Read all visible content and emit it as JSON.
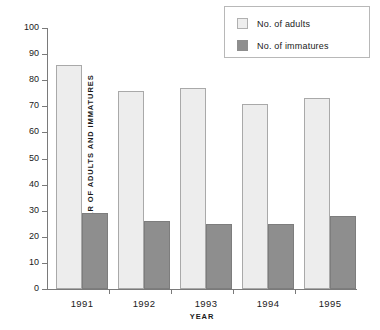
{
  "chart_data": {
    "type": "bar",
    "title": "",
    "xlabel": "YEAR",
    "ylabel": "NUMBER OF ADULTS AND IMMATURES",
    "categories": [
      "1991",
      "1992",
      "1993",
      "1994",
      "1995"
    ],
    "series": [
      {
        "name": "No. of adults",
        "values": [
          86,
          76,
          77,
          71,
          73
        ],
        "color": "#ededed"
      },
      {
        "name": "No. of immatures",
        "values": [
          29,
          26,
          25,
          25,
          28
        ],
        "color": "#8e8e8e"
      }
    ],
    "ylim": [
      0,
      100
    ],
    "yticks": [
      0,
      10,
      20,
      30,
      40,
      50,
      60,
      70,
      80,
      90,
      100
    ],
    "grid": false,
    "legend_position": "top-right"
  },
  "legend": {
    "items": [
      {
        "label": "No. of adults",
        "swatch": "light-square-icon"
      },
      {
        "label": "No. of immatures",
        "swatch": "dark-square-icon"
      }
    ]
  }
}
